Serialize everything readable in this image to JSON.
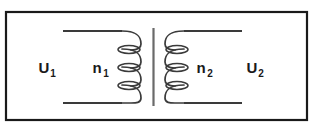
{
  "figure": {
    "type": "circuit-diagram",
    "background_color": "#ffffff",
    "line_color": "#1a1a1a",
    "border": {
      "name": "diagram-frame",
      "stroke_color": "#1a1a1a",
      "stroke_width": 2,
      "x": 5,
      "y": 11,
      "width": 303,
      "height": 110
    },
    "core": {
      "name": "transformer-core",
      "orientation": "vertical",
      "stroke_color": "#555555",
      "stroke_width": 2,
      "x": 153,
      "y_top": 28,
      "y_bottom": 106
    },
    "primary": {
      "side": "left",
      "winding_label": "n",
      "winding_subscript": "1",
      "voltage_label": "U",
      "voltage_subscript": "1",
      "turns_drawn": 3,
      "lead_x_start": 63,
      "lead_x_end": 128,
      "lead_y_top": 31,
      "lead_y_bottom": 103
    },
    "secondary": {
      "side": "right",
      "winding_label": "n",
      "winding_subscript": "2",
      "voltage_label": "U",
      "voltage_subscript": "2",
      "turns_drawn": 3,
      "lead_x_start": 242,
      "lead_x_end": 178,
      "lead_y_top": 31,
      "lead_y_bottom": 103
    },
    "labels": {
      "primary_voltage": {
        "text": "U",
        "subscript": "1",
        "x": 44,
        "y": 73
      },
      "primary_turns": {
        "text": "n",
        "subscript": "1",
        "x": 96,
        "y": 73
      },
      "secondary_turns": {
        "text": "n",
        "subscript": "2",
        "x": 200,
        "y": 73
      },
      "secondary_voltage": {
        "text": "U",
        "subscript": "2",
        "x": 251,
        "y": 73
      }
    }
  }
}
